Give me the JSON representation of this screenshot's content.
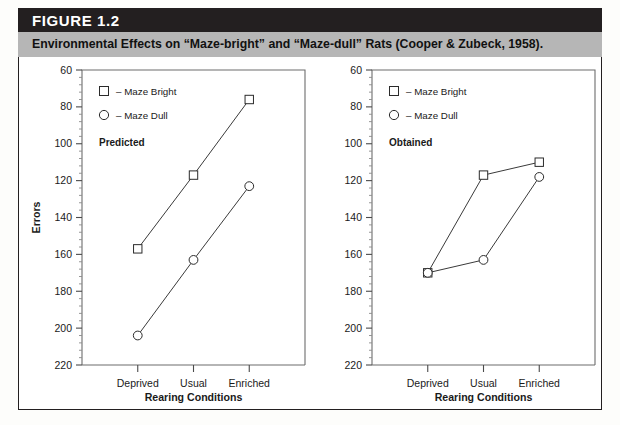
{
  "figure": {
    "number_label": "FIGURE 1.2",
    "caption": "Environmental Effects on “Maze-bright” and “Maze-dull” Rats (Cooper & Zubeck, 1958).",
    "header_bg": "#231f20",
    "caption_bg": "#b6b6b6"
  },
  "legend": {
    "bright_label": "– Maze Bright",
    "dull_label": "– Maze Dull",
    "bright_marker": "square-marker-icon",
    "dull_marker": "circle-marker-icon"
  },
  "chart_data": [
    {
      "type": "line",
      "panel_label": "Predicted",
      "title": "",
      "xlabel": "Rearing Conditions",
      "ylabel": "Errors",
      "categories": [
        "Deprived",
        "Usual",
        "Enriched"
      ],
      "ylim": [
        60,
        220
      ],
      "y_inverted": true,
      "yticks": [
        60,
        80,
        100,
        120,
        140,
        160,
        180,
        200,
        220
      ],
      "ytick_labels": [
        "60",
        "80",
        "100",
        "120",
        "140",
        "160",
        "180",
        "200",
        "220"
      ],
      "minor_ticks_per_interval": 4,
      "grid": false,
      "legend_position": "top-left",
      "series": [
        {
          "name": "Maze Bright",
          "marker": "square",
          "values": [
            157,
            117,
            76
          ]
        },
        {
          "name": "Maze Dull",
          "marker": "circle",
          "values": [
            204,
            163,
            123
          ]
        }
      ]
    },
    {
      "type": "line",
      "panel_label": "Obtained",
      "title": "",
      "xlabel": "Rearing Conditions",
      "ylabel": "",
      "categories": [
        "Deprived",
        "Usual",
        "Enriched"
      ],
      "ylim": [
        60,
        220
      ],
      "y_inverted": true,
      "yticks": [
        60,
        80,
        100,
        120,
        140,
        160,
        180,
        200,
        220
      ],
      "ytick_labels": [
        "60",
        "80",
        "100",
        "120",
        "140",
        "160",
        "180",
        "200",
        "220"
      ],
      "minor_ticks_per_interval": 4,
      "grid": false,
      "legend_position": "top-left",
      "series": [
        {
          "name": "Maze Bright",
          "marker": "square",
          "values": [
            170,
            117,
            110
          ]
        },
        {
          "name": "Maze Dull",
          "marker": "circle",
          "values": [
            170,
            163,
            118
          ]
        }
      ]
    }
  ]
}
